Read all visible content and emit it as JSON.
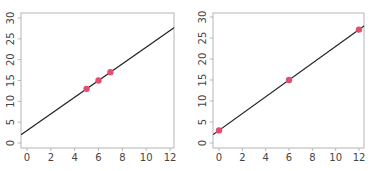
{
  "chart_data": [
    {
      "type": "scatter",
      "title": "",
      "xlabel": "",
      "ylabel": "",
      "xlim": [
        -0.5,
        12.5
      ],
      "ylim": [
        -1,
        31
      ],
      "x_ticks": [
        "0",
        "2",
        "4",
        "6",
        "8",
        "10",
        "12"
      ],
      "y_ticks": [
        "0",
        "5",
        "10",
        "15",
        "20",
        "25",
        "30"
      ],
      "grid": false,
      "points": {
        "x": [
          5,
          6,
          7
        ],
        "y": [
          13,
          15,
          17
        ]
      },
      "fit_line": {
        "intercept": 3,
        "slope": 2
      },
      "point_color": "#e0506e",
      "line_color": "#222222"
    },
    {
      "type": "scatter",
      "title": "",
      "xlabel": "",
      "ylabel": "",
      "xlim": [
        -0.5,
        12.5
      ],
      "ylim": [
        -1,
        31
      ],
      "x_ticks": [
        "0",
        "2",
        "4",
        "6",
        "8",
        "10",
        "12"
      ],
      "y_ticks": [
        "0",
        "5",
        "10",
        "15",
        "20",
        "25",
        "30"
      ],
      "grid": false,
      "points": {
        "x": [
          0,
          6,
          12
        ],
        "y": [
          3,
          15,
          27
        ]
      },
      "fit_line": {
        "intercept": 3,
        "slope": 2
      },
      "point_color": "#e0506e",
      "line_color": "#222222"
    }
  ]
}
